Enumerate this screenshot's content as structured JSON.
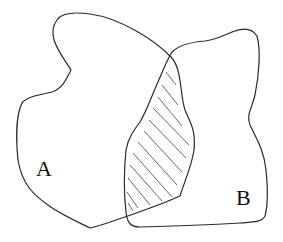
{
  "diagram": {
    "type": "venn-diagram",
    "sets": [
      {
        "id": "A",
        "label": "A"
      },
      {
        "id": "B",
        "label": "B"
      }
    ],
    "intersection": {
      "sets": [
        "A",
        "B"
      ],
      "fill": "hatched",
      "hatch_color": "#555555"
    },
    "colors": {
      "outline": "#2a2a2a",
      "background": "#ffffff"
    }
  }
}
